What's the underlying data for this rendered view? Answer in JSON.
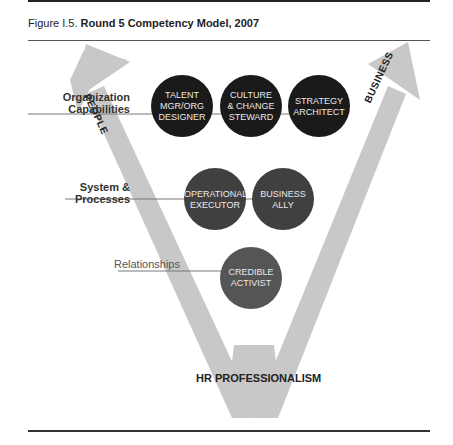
{
  "figure": {
    "number": "Figure I.5.",
    "title": "Round 5 Competency Model, 2007"
  },
  "arrows": {
    "left": "PEOPLE",
    "right": "BUSINESS"
  },
  "base": "HR PROFESSIONALISM",
  "tiers": [
    {
      "label_line1": "Organization",
      "label_line2": "Capabilities",
      "competencies": [
        {
          "line1": "TALENT",
          "line2": "MGR/ORG",
          "line3": "DESIGNER"
        },
        {
          "line1": "CULTURE",
          "line2": "& CHANGE",
          "line3": "STEWARD"
        },
        {
          "line1": "STRATEGY",
          "line2": "ARCHITECT",
          "line3": ""
        }
      ],
      "circle_color": "#1a1a1a"
    },
    {
      "label_line1": "System &",
      "label_line2": "Processes",
      "competencies": [
        {
          "line1": "OPERATIONAL",
          "line2": "EXECUTOR"
        },
        {
          "line1": "BUSINESS",
          "line2": "ALLY"
        }
      ],
      "circle_color": "#404040"
    },
    {
      "label_line1": "Relationships",
      "competencies": [
        {
          "line1": "CREDIBLE",
          "line2": "ACTIVIST"
        }
      ],
      "circle_color": "#555555"
    }
  ],
  "colors": {
    "arrow": "#c6c6c6",
    "rule": "#333333"
  }
}
